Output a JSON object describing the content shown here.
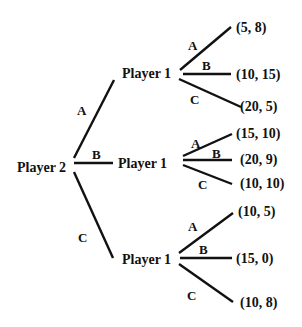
{
  "diagram": {
    "type": "game-tree",
    "root": {
      "label": "Player 2",
      "branches": [
        {
          "action": "A",
          "node": {
            "label": "Player 1",
            "branches": [
              {
                "action": "A",
                "payoff": "(5, 8)"
              },
              {
                "action": "B",
                "payoff": "(10, 15)"
              },
              {
                "action": "C",
                "payoff": "(20, 5)"
              }
            ]
          }
        },
        {
          "action": "B",
          "node": {
            "label": "Player 1",
            "branches": [
              {
                "action": "A",
                "payoff": "(15, 10)"
              },
              {
                "action": "B",
                "payoff": "(20, 9)"
              },
              {
                "action": "C",
                "payoff": "(10, 10)"
              }
            ]
          }
        },
        {
          "action": "C",
          "node": {
            "label": "Player 1",
            "branches": [
              {
                "action": "A",
                "payoff": "(10, 5)"
              },
              {
                "action": "B",
                "payoff": "(15, 0)"
              },
              {
                "action": "C",
                "payoff": "(10, 8)"
              }
            ]
          }
        }
      ]
    }
  },
  "colors": {
    "ink": "#111111",
    "background": "#ffffff"
  }
}
